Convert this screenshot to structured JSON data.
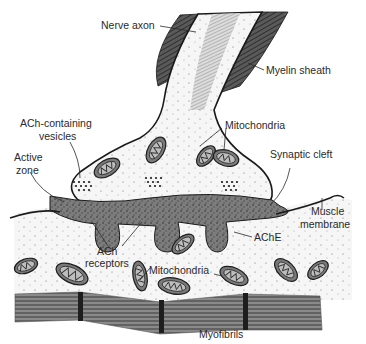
{
  "diagram": {
    "labels": {
      "nerve_axon": "Nerve axon",
      "myelin_sheath": "Myelin sheath",
      "ach_vesicles_line1": "ACh-containing",
      "ach_vesicles_line2": "vesicles",
      "active_zone_line1": "Active",
      "active_zone_line2": "zone",
      "mitochondria_top": "Mitochondria",
      "synaptic_cleft": "Synaptic cleft",
      "muscle_membrane_line1": "Muscle",
      "muscle_membrane_line2": "membrane",
      "ache": "AChE",
      "ach_receptors_line1": "ACh",
      "ach_receptors_line2": "receptors",
      "mitochondria_bottom": "Mitochondria",
      "myofibrils": "Myofibrils"
    },
    "colors": {
      "ink": "#1a1a1a",
      "myelin": "#4a4a4a",
      "axon_fill": "#eeeeee",
      "cleft_stipple": "#6e6e6e",
      "muscle_fill": "#f4f4f4",
      "myofibril": "#7d7d7d",
      "z_band": "#222222"
    }
  }
}
